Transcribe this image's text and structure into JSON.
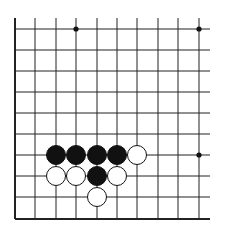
{
  "diagram": {
    "type": "go-board-fragment",
    "columns_x": [
      15,
      35,
      56,
      76,
      97,
      117,
      137,
      158,
      178,
      199
    ],
    "rows_y": [
      29,
      50,
      71,
      92,
      113,
      134,
      155,
      176,
      197,
      219
    ],
    "vertical_top_y": 18,
    "horizontal_right_x": 210,
    "edges": [
      "left",
      "bottom"
    ],
    "line_color": "#222222",
    "star_points": [
      {
        "x": 76,
        "y": 29
      },
      {
        "x": 199,
        "y": 29
      },
      {
        "x": 199,
        "y": 155
      }
    ],
    "stones": [
      {
        "color": "black",
        "x": 56,
        "y": 155
      },
      {
        "color": "black",
        "x": 76,
        "y": 155
      },
      {
        "color": "black",
        "x": 97,
        "y": 155
      },
      {
        "color": "black",
        "x": 117,
        "y": 155
      },
      {
        "color": "white",
        "x": 137,
        "y": 155
      },
      {
        "color": "white",
        "x": 56,
        "y": 176
      },
      {
        "color": "white",
        "x": 76,
        "y": 176
      },
      {
        "color": "black",
        "x": 97,
        "y": 176
      },
      {
        "color": "white",
        "x": 117,
        "y": 176
      },
      {
        "color": "white",
        "x": 97,
        "y": 197
      }
    ],
    "stone_radius": 9.5
  }
}
